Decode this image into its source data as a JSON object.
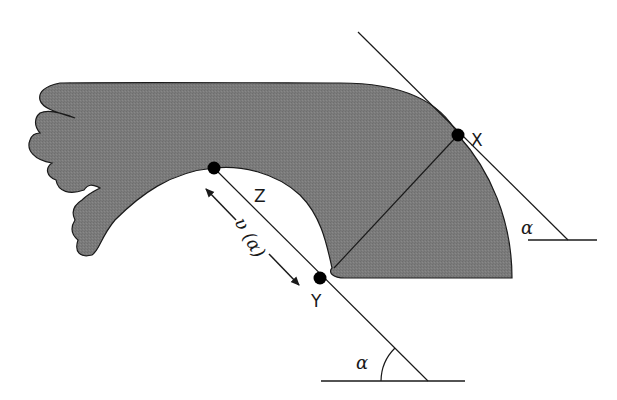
{
  "figure": {
    "type": "geometric-diagram",
    "colors": {
      "shape_fill": "#7a7a7a",
      "shape_stroke": "#1a1a1a",
      "line": "#1a1a1a",
      "point": "#000000",
      "background": "#ffffff"
    },
    "points": [
      {
        "id": "X",
        "label": "X"
      },
      {
        "id": "Y",
        "label": "Y"
      },
      {
        "id": "Z",
        "label": "Z"
      }
    ],
    "labels": {
      "x": "X",
      "y": "Y",
      "z": "Z",
      "distance": "υ (α)",
      "angle_upper": "α",
      "angle_lower": "α"
    }
  }
}
